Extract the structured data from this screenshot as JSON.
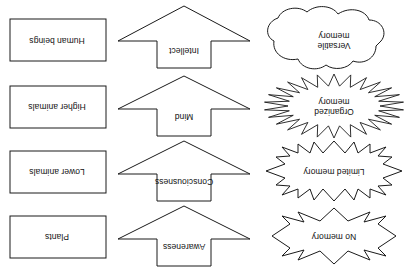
{
  "diagram": {
    "orientation": "rotated-180",
    "stroke_color": "#1a1a1a",
    "fill_color": "#ffffff",
    "background_color": "#ffffff",
    "columns": [
      {
        "key": "memory",
        "name": "memory-column"
      },
      {
        "key": "faculty",
        "name": "faculty-arrow-column"
      },
      {
        "key": "organism",
        "name": "organism-column"
      }
    ],
    "rows": [
      {
        "memory": {
          "label": "No memory",
          "shape": "explosion-4-point"
        },
        "faculty": {
          "label": "Awareness",
          "shape": "down-arrow"
        },
        "organism": {
          "label": "Plants",
          "shape": "rectangle"
        }
      },
      {
        "memory": {
          "label": "Limited memory",
          "shape": "explosion-8-point"
        },
        "faculty": {
          "label": "Consciousness",
          "shape": "down-arrow"
        },
        "organism": {
          "label": "Lower animals",
          "shape": "rectangle"
        }
      },
      {
        "memory": {
          "label": "Organized\nmemory",
          "shape": "sunburst"
        },
        "faculty": {
          "label": "Mind",
          "shape": "down-arrow"
        },
        "organism": {
          "label": "Higher animals",
          "shape": "rectangle"
        }
      },
      {
        "memory": {
          "label": "Versatile\nmemory",
          "shape": "cloud"
        },
        "faculty": {
          "label": "Intellect",
          "shape": "down-arrow"
        },
        "organism": {
          "label": "Human beings",
          "shape": "rectangle"
        }
      }
    ]
  }
}
